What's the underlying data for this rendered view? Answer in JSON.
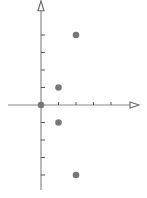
{
  "chart_data": {
    "type": "scatter",
    "title": "",
    "xlabel": "",
    "ylabel": "",
    "grid": false,
    "legend": null,
    "axes": {
      "x_ticks": [
        1,
        2,
        3,
        4
      ],
      "y_ticks": [
        -4,
        -3,
        -2,
        -1,
        1,
        2,
        3,
        4
      ],
      "xlim": [
        -1.9,
        5.6
      ],
      "ylim": [
        -4.8,
        5.9
      ],
      "arrows": [
        "x-positive",
        "y-positive"
      ],
      "tick_labels_shown": false
    },
    "series": [
      {
        "name": "points",
        "x": [
          0,
          1,
          1,
          2,
          2
        ],
        "y": [
          0,
          1,
          -1,
          4,
          -4
        ]
      }
    ]
  },
  "colors": {
    "axis": "#8a8a8a",
    "tick": "#555555",
    "point": "#777777",
    "background": "#ffffff"
  }
}
